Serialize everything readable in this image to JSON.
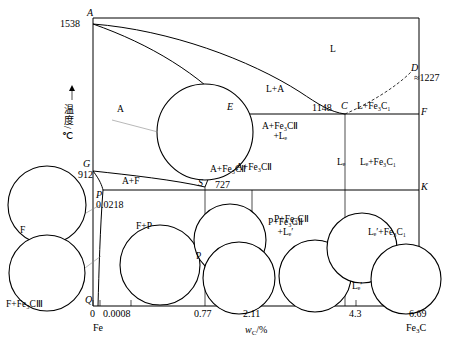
{
  "figure": {
    "type": "phase-diagram",
    "name": "Fe-Fe3C phase diagram",
    "y_axis_label": "温度/℃",
    "x_axis_label_main": "w",
    "x_axis_label_sub": "C",
    "x_axis_label_unit": "/%",
    "x_left_end": "Fe",
    "x_right_end_main": "Fe",
    "x_right_end_sub": "3",
    "x_right_end_tail": "C"
  },
  "x_ticks": [
    "0",
    "0.0008",
    "0.77",
    "2.11",
    "4.3",
    "6.69"
  ],
  "temperatures": {
    "A": "1538",
    "D": "≈1227",
    "E_line": "1148",
    "G": "912",
    "S_line": "727",
    "P": "0.0218"
  },
  "points": [
    {
      "id": "A",
      "label": "A"
    },
    {
      "id": "D",
      "label": "D"
    },
    {
      "id": "C",
      "label": "C"
    },
    {
      "id": "F",
      "label": "F"
    },
    {
      "id": "E",
      "label": "E"
    },
    {
      "id": "G",
      "label": "G"
    },
    {
      "id": "S",
      "label": "S"
    },
    {
      "id": "P",
      "label": "P"
    },
    {
      "id": "K",
      "label": "K"
    },
    {
      "id": "Q",
      "label": "Q"
    }
  ],
  "regions": [
    {
      "id": "L",
      "text": "L"
    },
    {
      "id": "L_A",
      "text": "L+A"
    },
    {
      "id": "A",
      "text": "A"
    },
    {
      "id": "A_F",
      "text": "A+F"
    },
    {
      "id": "L_Fe3CI",
      "text": "L+Fe₃C₁"
    },
    {
      "id": "A_Fe3CII_Ld",
      "line1": "A+Fe₃CⅡ",
      "line2": "+Lₑ"
    },
    {
      "id": "A_Fe3CII",
      "text": "A+Fe₃CⅡ"
    },
    {
      "id": "Ld",
      "text": "Lₑ"
    },
    {
      "id": "Ld_Fe3CI",
      "text": "Lₑ+Fe₃C₁"
    }
  ],
  "micrographs": [
    {
      "id": "austenite",
      "label": "A",
      "pos": "center-upper"
    },
    {
      "id": "ferrite",
      "label": "F",
      "pos": "left-upper"
    },
    {
      "id": "ferrite-cem3",
      "label": "F+Fe₃CⅢ",
      "pos": "left-lower"
    },
    {
      "id": "ferrite-pearlite",
      "label": "F+P",
      "pos": "bottom-1"
    },
    {
      "id": "pearlite",
      "label": "P",
      "pos": "bottom-2"
    },
    {
      "id": "pearlite-cem2",
      "label": "P+Fe₃CⅡ",
      "pos": "bottom-3"
    },
    {
      "id": "p-cem2-ld",
      "label_l1": "P+Fe₃CⅡ",
      "label_l2": "+Lₑ′",
      "pos": "bottom-4"
    },
    {
      "id": "ledeburite",
      "label": "Lₑ′",
      "pos": "bottom-5"
    },
    {
      "id": "ld-cem1",
      "label": "Lₑ′+Fe₃C₁",
      "pos": "bottom-6"
    }
  ],
  "annotations": {
    "P_value": "0.0218",
    "eutectoid_temp": "727",
    "eutectic_temp": "1148",
    "melt_temp": "1538",
    "D_temp": "≈1227"
  },
  "colors": {
    "line": "#000000",
    "background": "#ffffff",
    "leader": "#888888"
  }
}
